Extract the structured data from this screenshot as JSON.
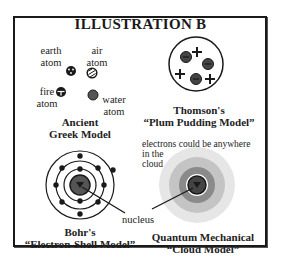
{
  "title": "ILLUSTRATION B",
  "ancient_greek": {
    "atoms": [
      {
        "name": "earth",
        "label_line1": "earth",
        "label_line2": "atom",
        "icon": "dotted-circle-icon"
      },
      {
        "name": "air",
        "label_line1": "air",
        "label_line2": "atom",
        "icon": "striped-circle-icon"
      },
      {
        "name": "fire",
        "label_line1": "fire",
        "label_line2": "atom",
        "icon": "cross-circle-icon"
      },
      {
        "name": "water",
        "label_line1": "water",
        "label_line2": "atom",
        "icon": "solid-gray-circle-icon"
      }
    ],
    "caption_line1": "Ancient",
    "caption_line2": "Greek Model"
  },
  "thomson": {
    "caption_line1": "Thomson's",
    "caption_line2": "“Plum Pudding Model”",
    "electrons": 4,
    "protons": 4
  },
  "bohr": {
    "caption_line1": "Bohr's",
    "caption_line2": "“Electron-Shell Model”",
    "shells": 3
  },
  "quantum": {
    "note_line1": "electrons could be anywhere",
    "note_line2": "in the",
    "note_line3": "cloud",
    "caption_line1": "Quantum Mechanical",
    "caption_line2": "“Cloud Model”"
  },
  "shared_label": "nucleus",
  "colors": {
    "ink": "#1a1a1a",
    "nucleus_gray": "#555555",
    "cloud_outer": "#e6e6e6",
    "cloud_mid": "#c4c4c4",
    "cloud_inner": "#8a8a8a"
  }
}
